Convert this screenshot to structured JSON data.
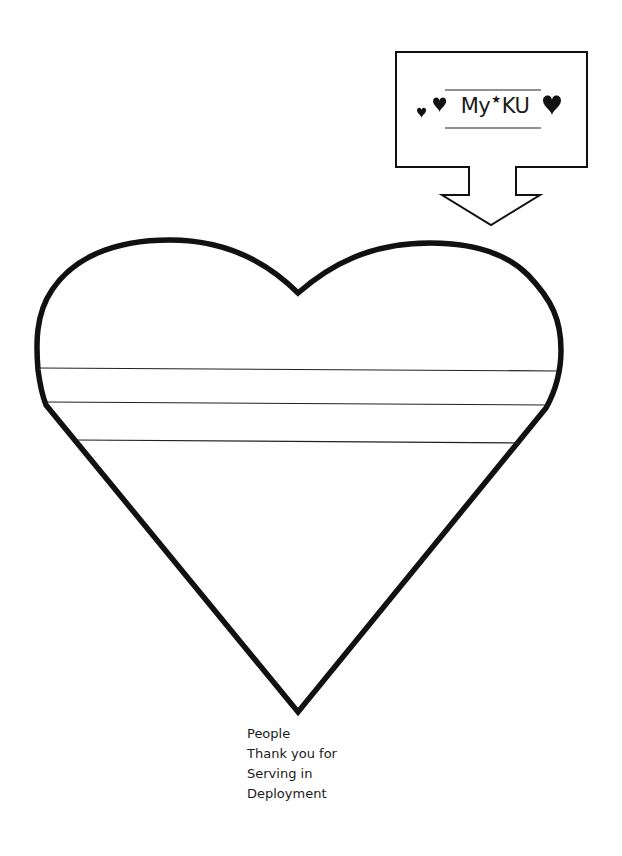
{
  "label_box": {
    "text_before": "My",
    "star": "★",
    "text_after": "KU",
    "decorations": [
      "heart-icon",
      "heart-icon",
      "heart-icon"
    ]
  },
  "heart": {
    "writing_lines": 3,
    "stroke_color": "#111111"
  },
  "caption": {
    "lines": [
      "People",
      "Thank you for",
      "Serving in",
      "Deployment"
    ]
  }
}
